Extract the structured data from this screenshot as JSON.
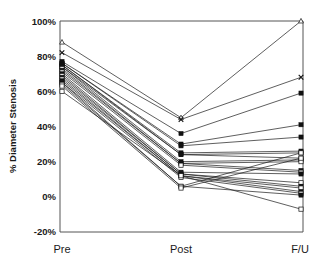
{
  "chart_data": {
    "type": "line",
    "title": "",
    "xlabel": "",
    "ylabel": "% Diameter Stenosis",
    "categories": [
      "Pre",
      "Post",
      "F/U"
    ],
    "ylim": [
      -20,
      100
    ],
    "ytick_labels": [
      "-20%",
      "0%",
      "20%",
      "40%",
      "60%",
      "80%",
      "100%"
    ],
    "ytick_values": [
      -20,
      0,
      20,
      40,
      60,
      80,
      100
    ],
    "grid": false,
    "legend_position": "none",
    "y_unit": "%",
    "note": "Paired spaghetti plot of percent diameter stenosis for individual lesions at three timepoints: Pre (before intervention), Post (immediately after), F/U (follow-up).",
    "series": [
      {
        "name": "Lesion 1",
        "marker": "triangle-open",
        "values": [
          88,
          45,
          100
        ]
      },
      {
        "name": "Lesion 2",
        "marker": "cross",
        "values": [
          82,
          44,
          68
        ]
      },
      {
        "name": "Lesion 3",
        "marker": "square-filled",
        "values": [
          77,
          36,
          59
        ]
      },
      {
        "name": "Lesion 4",
        "marker": "square-filled",
        "values": [
          76,
          30,
          41
        ]
      },
      {
        "name": "Lesion 5",
        "marker": "square-filled",
        "values": [
          76,
          29,
          34
        ]
      },
      {
        "name": "Lesion 6",
        "marker": "square-filled",
        "values": [
          75,
          25,
          26
        ]
      },
      {
        "name": "Lesion 7",
        "marker": "square-filled",
        "values": [
          75,
          24,
          25
        ]
      },
      {
        "name": "Lesion 8",
        "marker": "square-filled",
        "values": [
          74,
          24,
          22
        ]
      },
      {
        "name": "Lesion 9",
        "marker": "square-filled",
        "values": [
          74,
          20,
          21
        ]
      },
      {
        "name": "Lesion 10",
        "marker": "square-open",
        "values": [
          73,
          19,
          20
        ]
      },
      {
        "name": "Lesion 11",
        "marker": "square-filled",
        "values": [
          72,
          19,
          15
        ]
      },
      {
        "name": "Lesion 12",
        "marker": "square-open",
        "values": [
          71,
          18,
          14
        ]
      },
      {
        "name": "Lesion 13",
        "marker": "square-filled",
        "values": [
          70,
          14,
          13
        ]
      },
      {
        "name": "Lesion 14",
        "marker": "square-open",
        "values": [
          69,
          13,
          8
        ]
      },
      {
        "name": "Lesion 15",
        "marker": "square-filled",
        "values": [
          68,
          13,
          6
        ]
      },
      {
        "name": "Lesion 16",
        "marker": "square-open",
        "values": [
          67,
          12,
          5
        ]
      },
      {
        "name": "Lesion 17",
        "marker": "square-filled",
        "values": [
          66,
          12,
          3
        ]
      },
      {
        "name": "Lesion 18",
        "marker": "square-open",
        "values": [
          65,
          11,
          2
        ]
      },
      {
        "name": "Lesion 19",
        "marker": "square-filled",
        "values": [
          65,
          6,
          1
        ]
      },
      {
        "name": "Lesion 20",
        "marker": "square-open",
        "values": [
          64,
          6,
          25
        ]
      },
      {
        "name": "Lesion 21",
        "marker": "square-open",
        "values": [
          63,
          5,
          22
        ]
      },
      {
        "name": "Lesion 22",
        "marker": "square-open",
        "values": [
          60,
          12,
          -7
        ]
      }
    ]
  },
  "axes": {
    "y_axis_title": "% Diameter Stenosis",
    "x_tick_labels": [
      "Pre",
      "Post",
      "F/U"
    ],
    "y_tick_labels": [
      "100%",
      "80%",
      "60%",
      "40%",
      "20%",
      "0%",
      "-20%"
    ]
  },
  "colors": {
    "line": "#1a1a1a",
    "frame": "#555555",
    "background": "#ffffff",
    "marker_fill": "#111111",
    "marker_open_fill": "#ffffff"
  }
}
